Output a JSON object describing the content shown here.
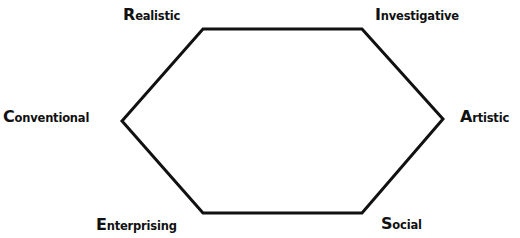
{
  "diagram": {
    "type": "hexagon",
    "stroke_color": "#111111",
    "stroke_width": 3,
    "vertices": {
      "realistic": [
        203,
        29
      ],
      "investigative": [
        362,
        29
      ],
      "artistic": [
        443,
        119
      ],
      "social": [
        362,
        213
      ],
      "enterprising": [
        203,
        213
      ],
      "conventional": [
        122,
        121
      ]
    },
    "labels": [
      {
        "id": "realistic",
        "initial": "R",
        "rest": "ealistic"
      },
      {
        "id": "investigative",
        "initial": "I",
        "rest": "nvestigative"
      },
      {
        "id": "artistic",
        "initial": "A",
        "rest": "rtistic"
      },
      {
        "id": "social",
        "initial": "S",
        "rest": "ocial"
      },
      {
        "id": "enterprising",
        "initial": "E",
        "rest": "nterprising"
      },
      {
        "id": "conventional",
        "initial": "C",
        "rest": "onventional"
      }
    ]
  }
}
